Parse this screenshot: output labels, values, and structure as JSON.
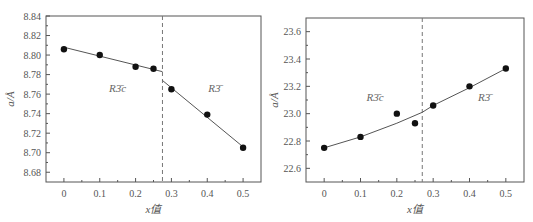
{
  "chart_data": [
    {
      "type": "scatter",
      "title": "",
      "xlabel": "x值",
      "ylabel": "a/Å",
      "xlim": [
        -0.05,
        0.55
      ],
      "ylim": [
        8.67,
        8.84
      ],
      "xticks": [
        0,
        0.1,
        0.2,
        0.3,
        0.4,
        0.5
      ],
      "xtick_labels": [
        "0",
        "0.1",
        "0.2",
        "0.3",
        "0.4",
        "0.5"
      ],
      "yticks": [
        8.68,
        8.7,
        8.72,
        8.74,
        8.76,
        8.78,
        8.8,
        8.82,
        8.84
      ],
      "ytick_labels": [
        "8.68",
        "8.70",
        "8.72",
        "8.74",
        "8.76",
        "8.78",
        "8.80",
        "8.82",
        "8.84"
      ],
      "grid": false,
      "series": [
        {
          "name": "data",
          "x": [
            0,
            0.1,
            0.2,
            0.25,
            0.3,
            0.4,
            0.5
          ],
          "y": [
            8.806,
            8.8,
            8.788,
            8.786,
            8.765,
            8.739,
            8.705
          ]
        }
      ],
      "fit_lines": [
        {
          "name": "R-3c fit",
          "x": [
            0,
            0.275
          ],
          "y": [
            8.808,
            8.783
          ]
        },
        {
          "name": "R-3 fit",
          "x": [
            0.275,
            0.5
          ],
          "y": [
            8.774,
            8.706
          ]
        }
      ],
      "boundary_x": 0.275,
      "annotations": [
        {
          "text": "R3̄c",
          "x": 0.15,
          "y": 8.762
        },
        {
          "text": "R3̄",
          "x": 0.42,
          "y": 8.762
        }
      ]
    },
    {
      "type": "scatter",
      "title": "",
      "xlabel": "x值",
      "ylabel": "a/Å",
      "xlim": [
        -0.05,
        0.55
      ],
      "ylim": [
        22.5,
        23.7
      ],
      "xticks": [
        0,
        0.1,
        0.2,
        0.3,
        0.4,
        0.5
      ],
      "xtick_labels": [
        "0",
        "0.1",
        "0.2",
        "0.3",
        "0.4",
        "0.5"
      ],
      "yticks": [
        22.6,
        22.8,
        23.0,
        23.2,
        23.4,
        23.6
      ],
      "ytick_labels": [
        "22.6",
        "22.8",
        "23.0",
        "23.2",
        "23.4",
        "23.6"
      ],
      "grid": false,
      "series": [
        {
          "name": "data",
          "x": [
            0,
            0.1,
            0.2,
            0.25,
            0.3,
            0.4,
            0.5
          ],
          "y": [
            22.75,
            22.83,
            23.0,
            22.93,
            23.06,
            23.2,
            23.33
          ]
        }
      ],
      "fit_lines": [
        {
          "name": "R-3c fit",
          "x": [
            0,
            0.1,
            0.2,
            0.27
          ],
          "y": [
            22.75,
            22.83,
            22.93,
            23.01
          ]
        },
        {
          "name": "R-3 fit",
          "x": [
            0.27,
            0.3,
            0.4,
            0.5
          ],
          "y": [
            23.01,
            23.06,
            23.19,
            23.33
          ]
        }
      ],
      "boundary_x": 0.27,
      "annotations": [
        {
          "text": "R3̄c",
          "x": 0.14,
          "y": 23.09
        },
        {
          "text": "R3̄",
          "x": 0.44,
          "y": 23.09
        }
      ]
    }
  ],
  "left": {
    "xlabel": "x值",
    "ylabel": "a/Å",
    "phase1": "R3̄c",
    "phase2": "R3̄"
  },
  "right": {
    "xlabel": "x值",
    "ylabel": "a/Å",
    "phase1": "R3̄c",
    "phase2": "R3̄"
  },
  "style": {
    "axis_color": "#555555",
    "point_color": "#111111",
    "line_color": "#555555",
    "dash_color": "#777777"
  }
}
